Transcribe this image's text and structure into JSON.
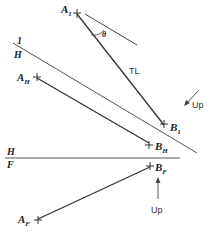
{
  "diagram": {
    "type": "descriptive-geometry-true-length",
    "points": {
      "A1": {
        "label": "A",
        "sub": "1"
      },
      "B1": {
        "label": "B",
        "sub": "1"
      },
      "AH": {
        "label": "A",
        "sub": "H"
      },
      "BH": {
        "label": "B",
        "sub": "H"
      },
      "AF": {
        "label": "A",
        "sub": "F"
      },
      "BF": {
        "label": "B",
        "sub": "F"
      }
    },
    "fold_lines": [
      {
        "id": "H-1",
        "top": "1",
        "bottom": "H"
      },
      {
        "id": "H-F",
        "top": "H",
        "bottom": "F"
      }
    ],
    "annotations": {
      "true_length": "TL",
      "angle": "θ",
      "up_1": "Up",
      "up_2": "Up"
    },
    "colors": {
      "line": "#333333",
      "fold": "#555555"
    }
  }
}
